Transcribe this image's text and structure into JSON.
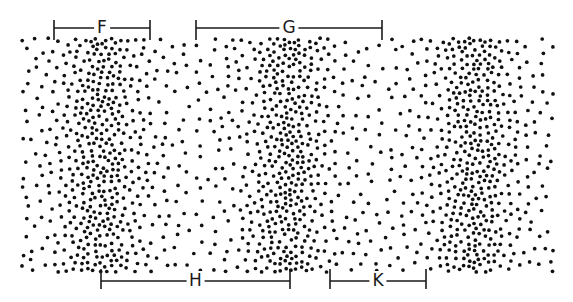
{
  "figure": {
    "type": "longitudinal-wave",
    "background": "#ffffff",
    "dot_color": "#111111",
    "field": {
      "x0": 22,
      "x1": 553,
      "y0": 38,
      "y1": 272
    },
    "compressions": [
      {
        "center_x": 100,
        "label": "compression"
      },
      {
        "center_x": 287,
        "label": "compression"
      },
      {
        "center_x": 475,
        "label": "compression"
      }
    ],
    "rarefactions": [
      {
        "center_x": 194,
        "label": "rarefaction"
      },
      {
        "center_x": 381,
        "label": "rarefaction"
      }
    ]
  },
  "brackets": [
    {
      "id": "F",
      "label": "F",
      "x0": 54,
      "x1": 150,
      "y": 28,
      "tick_up": 8,
      "tick_down": 12,
      "label_y": 18
    },
    {
      "id": "G",
      "label": "G",
      "x0": 196,
      "x1": 382,
      "y": 28,
      "tick_up": 8,
      "tick_down": 12,
      "label_y": 18
    },
    {
      "id": "H",
      "label": "H",
      "x0": 101,
      "x1": 290,
      "y": 281,
      "tick_up": 12,
      "tick_down": 8,
      "label_y": 272
    },
    {
      "id": "K",
      "label": "K",
      "x0": 330,
      "x1": 426,
      "y": 281,
      "tick_up": 12,
      "tick_down": 8,
      "label_y": 272
    }
  ]
}
